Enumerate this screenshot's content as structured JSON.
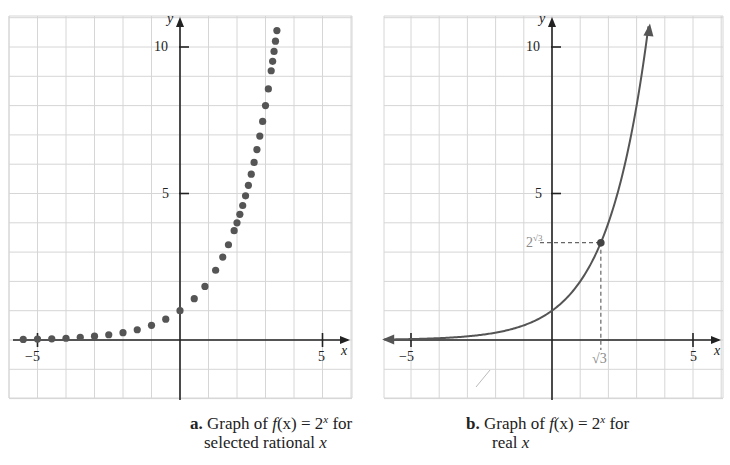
{
  "colors": {
    "grid": "#d6d6d6",
    "axis": "#222222",
    "curve": "#555555",
    "dots": "#555555",
    "label_gray": "#8a8a8a"
  },
  "panels": [
    {
      "id": "a",
      "caption_letter": "a.",
      "caption_line1_pre": " Graph of ",
      "caption_fx": "f",
      "caption_mid": "(x) = 2",
      "caption_exp": "x",
      "caption_post": " for",
      "caption_line2_pre": "selected rational ",
      "caption_line2_var": "x",
      "x_axis_label": "x",
      "y_axis_label": "y",
      "tick_labels": {
        "x_neg5": "−5",
        "x_5": "5",
        "y_5": "5",
        "y_10": "10"
      }
    },
    {
      "id": "b",
      "caption_letter": "b.",
      "caption_line1_pre": " Graph of ",
      "caption_fx": "f",
      "caption_mid": "(x) = 2",
      "caption_exp": "x",
      "caption_post": " for",
      "caption_line2_pre": "real ",
      "caption_line2_var": "x",
      "x_axis_label": "x",
      "y_axis_label": "y",
      "tick_labels": {
        "x_neg5": "−5",
        "x_5": "5",
        "y_5": "5",
        "y_10": "10"
      },
      "annotation_x": "√3",
      "annotation_y_base": "2",
      "annotation_y_exp": "√3"
    }
  ],
  "chart_data": [
    {
      "type": "scatter",
      "title": "a. Graph of f(x) = 2^x for selected rational x",
      "xlabel": "x",
      "ylabel": "y",
      "xlim": [
        -6,
        6
      ],
      "ylim": [
        -2,
        11
      ],
      "grid": true,
      "x_ticks_labeled": [
        -5,
        5
      ],
      "y_ticks_labeled": [
        5,
        10
      ],
      "series": [
        {
          "name": "f(x) = 2^x (rational x)",
          "x": [
            -5.5,
            -5.0,
            -4.5,
            -4.0,
            -3.5,
            -3.0,
            -2.5,
            -2.0,
            -1.5,
            -1.0,
            -0.5,
            0.0,
            0.5,
            0.875,
            1.25,
            1.5,
            1.7,
            1.9,
            2.0,
            2.1,
            2.2,
            2.3,
            2.4,
            2.5,
            2.6,
            2.7,
            2.8,
            2.9,
            3.0,
            3.1,
            3.2,
            3.25,
            3.3,
            3.35,
            3.4
          ],
          "y": [
            0.02,
            0.03,
            0.04,
            0.06,
            0.09,
            0.13,
            0.18,
            0.25,
            0.35,
            0.5,
            0.71,
            1.0,
            1.41,
            1.83,
            2.38,
            2.83,
            3.25,
            3.73,
            4.0,
            4.29,
            4.59,
            4.92,
            5.28,
            5.66,
            6.06,
            6.5,
            6.96,
            7.46,
            8.0,
            8.57,
            9.19,
            9.51,
            9.85,
            10.2,
            10.56
          ]
        }
      ]
    },
    {
      "type": "line",
      "title": "b. Graph of f(x) = 2^x for real x",
      "xlabel": "x",
      "ylabel": "y",
      "xlim": [
        -6,
        6
      ],
      "ylim": [
        -2,
        11
      ],
      "grid": true,
      "x_ticks_labeled": [
        -5,
        5
      ],
      "y_ticks_labeled": [
        5,
        10
      ],
      "series": [
        {
          "name": "f(x) = 2^x",
          "x": [
            -6,
            -5,
            -4,
            -3,
            -2,
            -1,
            0,
            1,
            1.732,
            2,
            2.5,
            3,
            3.4
          ],
          "y": [
            0.016,
            0.031,
            0.063,
            0.125,
            0.25,
            0.5,
            1,
            2,
            3.32,
            4,
            5.66,
            8,
            10.56
          ]
        }
      ],
      "annotations": [
        {
          "point": [
            1.732,
            3.32
          ],
          "x_label": "√3",
          "y_label": "2^√3",
          "dashed_guides": true
        }
      ]
    }
  ],
  "geometry": {
    "a": {
      "left": 9,
      "top": 16,
      "right": 352,
      "bottom": 398,
      "ox": 180,
      "oy": 340,
      "sx": 28.5,
      "sy": 29.3
    },
    "b": {
      "left": 384,
      "top": 16,
      "right": 723,
      "bottom": 398,
      "ox": 552,
      "oy": 340,
      "sx": 28.2,
      "sy": 29.3
    }
  }
}
